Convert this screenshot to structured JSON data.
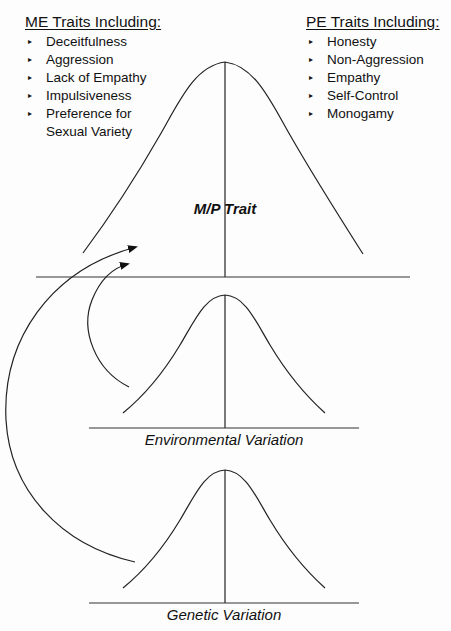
{
  "me_traits": {
    "heading": "ME Traits Including:",
    "items": [
      "Deceitfulness",
      "Aggression",
      "Lack of Empathy",
      "Impulsiveness",
      "Preference for Sexual Variety"
    ],
    "item_lines": [
      [
        "Deceitfulness"
      ],
      [
        "Aggression"
      ],
      [
        "Lack of Empathy"
      ],
      [
        "Impulsiveness"
      ],
      [
        "Preference for",
        "Sexual Variety"
      ]
    ]
  },
  "pe_traits": {
    "heading": "PE Traits Including:",
    "items": [
      "Honesty",
      "Non-Aggression",
      "Empathy",
      "Self-Control",
      "Monogamy"
    ]
  },
  "curves": {
    "main": {
      "label": "M/P Trait"
    },
    "environmental": {
      "label": "Environmental Variation"
    },
    "genetic": {
      "label": "Genetic Variation"
    }
  },
  "bullet_glyph": "▸",
  "colors": {
    "line": "#222222",
    "text": "#111111",
    "background": "#fdfdfd"
  }
}
